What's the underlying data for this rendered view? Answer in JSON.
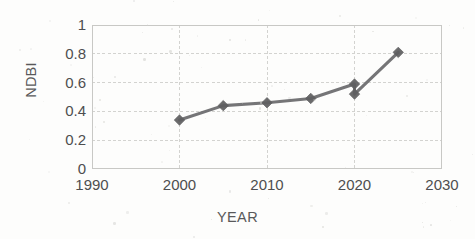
{
  "chart_data": {
    "type": "line",
    "title": "",
    "xlabel": "YEAR",
    "ylabel": "NDBI",
    "xlim": [
      1990,
      2030
    ],
    "ylim": [
      0,
      1
    ],
    "grid": true,
    "legend": "none",
    "x_ticks": [
      "1990",
      "2000",
      "2010",
      "2020",
      "2030"
    ],
    "x_tick_values": [
      1990,
      2000,
      2010,
      2020,
      2030
    ],
    "y_ticks": [
      "0",
      "0.2",
      "0.4",
      "0.6",
      "0.8",
      "1"
    ],
    "y_tick_values": [
      0,
      0.2,
      0.4,
      0.6,
      0.8,
      1
    ],
    "series": [
      {
        "name": "NDBI",
        "color": "#69696b",
        "marker": "diamond",
        "x": [
          2000,
          2005,
          2010,
          2015,
          2020,
          2020,
          2025
        ],
        "values": [
          0.34,
          0.44,
          0.46,
          0.49,
          0.59,
          0.52,
          0.81
        ]
      }
    ],
    "points": [
      {
        "x": 2000,
        "y": 0.34
      },
      {
        "x": 2005,
        "y": 0.44
      },
      {
        "x": 2010,
        "y": 0.46
      },
      {
        "x": 2015,
        "y": 0.49
      },
      {
        "x": 2020,
        "y": 0.59
      },
      {
        "x": 2020,
        "y": 0.52
      },
      {
        "x": 2025,
        "y": 0.81
      }
    ]
  },
  "axes": {
    "y_title": "NDBI",
    "x_title": "YEAR"
  },
  "style": {
    "line_color": "#69696b",
    "marker_color": "#5f5f61",
    "grid_color": "#d3d3d0",
    "axis_color": "#c8c8c5",
    "text_color": "#4e4e4f",
    "background": "#fdfdfc"
  }
}
